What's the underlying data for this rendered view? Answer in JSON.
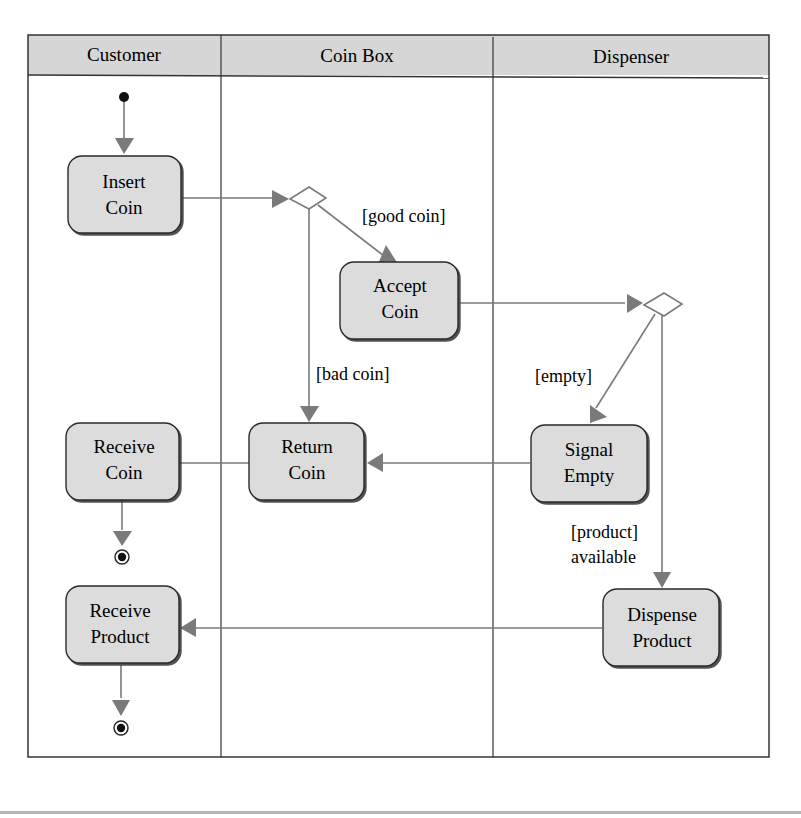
{
  "diagram": {
    "type": "UML activity diagram with swimlanes",
    "lanes": [
      {
        "id": "customer",
        "label": "Customer"
      },
      {
        "id": "coinbox",
        "label": "Coin Box"
      },
      {
        "id": "dispenser",
        "label": "Dispenser"
      }
    ],
    "nodes": {
      "insert_coin": {
        "line1": "Insert",
        "line2": "Coin"
      },
      "accept_coin": {
        "line1": "Accept",
        "line2": "Coin"
      },
      "return_coin": {
        "line1": "Return",
        "line2": "Coin"
      },
      "receive_coin": {
        "line1": "Receive",
        "line2": "Coin"
      },
      "signal_empty": {
        "line1": "Signal",
        "line2": "Empty"
      },
      "dispense_product": {
        "line1": "Dispense",
        "line2": "Product"
      },
      "receive_product": {
        "line1": "Receive",
        "line2": "Product"
      }
    },
    "guards": {
      "good_coin": "[good coin]",
      "bad_coin": "[bad coin]",
      "empty": "[empty]",
      "product_line1": "[product]",
      "product_line2": "available"
    },
    "colors": {
      "node_fill": "#dcdcdc",
      "header_fill": "#d6d6d6",
      "arrow": "#7a7a7a",
      "border": "#333333"
    }
  }
}
